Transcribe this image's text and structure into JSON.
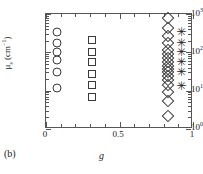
{
  "panel_label": "(b)",
  "axes": {
    "x_title": "g",
    "y_title_mu": "μ",
    "y_title_sub": "s",
    "y_title_unit_open": " (cm",
    "y_title_unit_sup": "−1",
    "y_title_unit_close": ")",
    "x_ticklabels": [
      "0",
      "0.5",
      "1"
    ],
    "y_ticklabels": [
      "10",
      "10",
      "10",
      "10"
    ],
    "y_tick_exponents": [
      "0",
      "1",
      "2",
      "3"
    ]
  },
  "chart_data": {
    "type": "scatter",
    "title": "",
    "xlabel": "g",
    "ylabel": "μs (cm−1)",
    "xlim": [
      0,
      1
    ],
    "ylim": [
      1,
      1000
    ],
    "yscale": "log",
    "xscale": "linear",
    "grid": false,
    "legend": "none",
    "x_ticks": [
      0,
      0.5,
      1
    ],
    "y_ticks": [
      1,
      10,
      100,
      1000
    ],
    "series": [
      {
        "name": "circles",
        "marker": "open-circle",
        "x": [
          0.075,
          0.075,
          0.075,
          0.075,
          0.075,
          0.075
        ],
        "y": [
          330,
          175,
          105,
          62,
          30,
          12
        ]
      },
      {
        "name": "squares",
        "marker": "open-square",
        "x": [
          0.315,
          0.315,
          0.315,
          0.315,
          0.315,
          0.315
        ],
        "y": [
          210,
          105,
          56,
          27,
          14,
          7
        ]
      },
      {
        "name": "diamonds",
        "marker": "open-diamond",
        "x": [
          0.83,
          0.83,
          0.83,
          0.83,
          0.83,
          0.83,
          0.83,
          0.83,
          0.83,
          0.83,
          0.83,
          0.83,
          0.83,
          0.83,
          0.83,
          0.83,
          0.83
        ],
        "y": [
          800,
          420,
          260,
          175,
          115,
          88,
          70,
          56,
          44,
          36,
          30,
          24,
          19,
          14,
          9.5,
          5.5,
          2.2
        ]
      },
      {
        "name": "asterisks",
        "marker": "asterisk",
        "x": [
          0.92,
          0.92,
          0.92,
          0.92,
          0.92,
          0.92
        ],
        "y": [
          330,
          175,
          100,
          56,
          30,
          13
        ]
      }
    ]
  },
  "glyphs": {
    "asterisk": "✳"
  }
}
